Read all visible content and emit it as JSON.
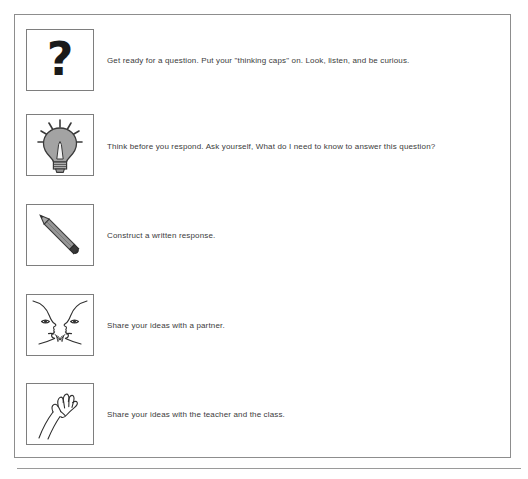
{
  "document": {
    "type": "instructional-poster",
    "rows": [
      {
        "icon": "question-mark-icon",
        "text": "Get ready for a question. Put your \"thinking caps\" on. Look, listen, and be curious."
      },
      {
        "icon": "lightbulb-icon",
        "text": "Think before you respond. Ask yourself, What do I need to know to answer this question?"
      },
      {
        "icon": "pencil-icon",
        "text": "Construct a written response."
      },
      {
        "icon": "talking-faces-icon",
        "text": "Share your ideas with a partner."
      },
      {
        "icon": "raised-hand-icon",
        "text": "Share your ideas with the teacher and the class."
      }
    ]
  },
  "style": {
    "frame_border_color": "#8d8d8d",
    "cell_border_color": "#7e7e7e",
    "text_color": "#3b3b3b",
    "icon_fill_gray": "#9e9e9e",
    "icon_line_color": "#3a3a3a",
    "page_background": "#ffffff"
  }
}
